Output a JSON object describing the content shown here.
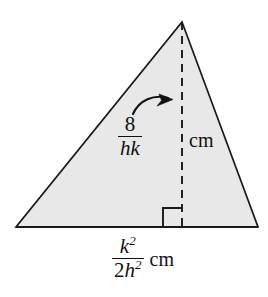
{
  "figure": {
    "name": "shaded-triangle-with-altitude",
    "background_color": "#ffffff",
    "fill_color": "#e8e8e8",
    "stroke_color": "#1a1a1a",
    "triangle": {
      "apex": {
        "x": 182,
        "y": 22
      },
      "bottom_left": {
        "x": 16,
        "y": 227
      },
      "bottom_right": {
        "x": 258,
        "y": 227
      }
    },
    "altitude": {
      "style": "dashed",
      "from": {
        "x": 182,
        "y": 22
      },
      "to": {
        "x": 182,
        "y": 227
      }
    },
    "right_angle_marker": {
      "x": 163,
      "y": 208,
      "size": 19
    },
    "pointer_arrow": {
      "description": "curved arrow from height label to altitude line",
      "tip": {
        "x": 172,
        "y": 99
      }
    }
  },
  "labels": {
    "height": {
      "numerator": "8",
      "denominator": "hk",
      "unit": "cm"
    },
    "base": {
      "numerator_base": "k",
      "numerator_exponent": "2",
      "denominator_coefficient": "2",
      "denominator_base": "h",
      "denominator_exponent": "2",
      "unit": "cm"
    }
  }
}
